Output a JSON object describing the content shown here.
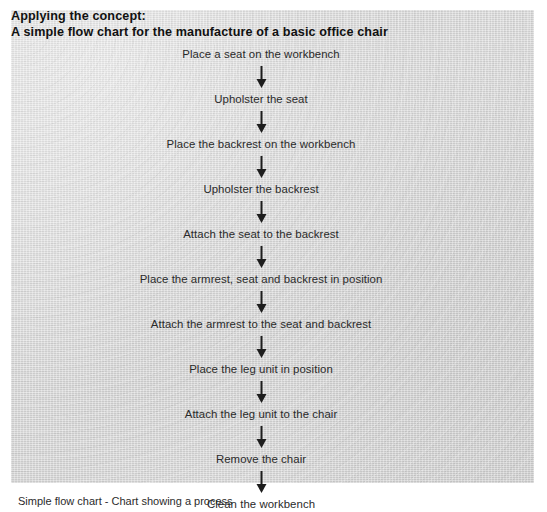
{
  "figure": {
    "heading": {
      "line1": "Applying the concept:",
      "line2": "A simple flow chart for the manufacture of a basic office chair"
    },
    "caption": "Simple flow chart - Chart showing a process",
    "panel_color": "#d9d9d9",
    "text_color": "#2a2a2a",
    "arrow_color": "#1d1d1d"
  },
  "chart_data": {
    "type": "diagram",
    "diagram_type": "flowchart",
    "orientation": "vertical",
    "title": "A simple flow chart for the manufacture of a basic office chair",
    "connector": "downward-arrow",
    "steps": [
      "Place a seat on the workbench",
      "Upholster the seat",
      "Place the backrest on the workbench",
      "Upholster the backrest",
      "Attach the seat to the backrest",
      "Place the armrest, seat and backrest in position",
      "Attach the armrest to the seat and backrest",
      "Place the leg unit in position",
      "Attach the leg unit to the chair",
      "Remove the chair",
      "Clean the workbench"
    ],
    "step_count": 11,
    "arrow_count": 10
  }
}
